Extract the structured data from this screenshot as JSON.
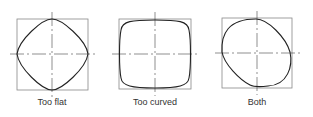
{
  "diagram": {
    "panels": [
      {
        "label": "Too flat",
        "shape": "diamond-like superellipse (under-rounded)",
        "center": [
          52,
          54
        ]
      },
      {
        "label": "Too curved",
        "shape": "squircle (over-rounded)",
        "center": [
          155,
          54
        ]
      },
      {
        "label": "Both",
        "shape": "asymmetric blob",
        "center": [
          257,
          53
        ]
      }
    ],
    "colors": {
      "box": "#888888",
      "curve": "#222222",
      "axis": "#444444"
    }
  }
}
